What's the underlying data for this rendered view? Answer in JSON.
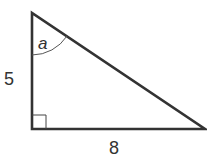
{
  "diagram": {
    "type": "right-triangle",
    "labels": {
      "vertical_side": "5",
      "horizontal_side": "8",
      "angle": "a"
    },
    "stroke_color": "#333333"
  }
}
